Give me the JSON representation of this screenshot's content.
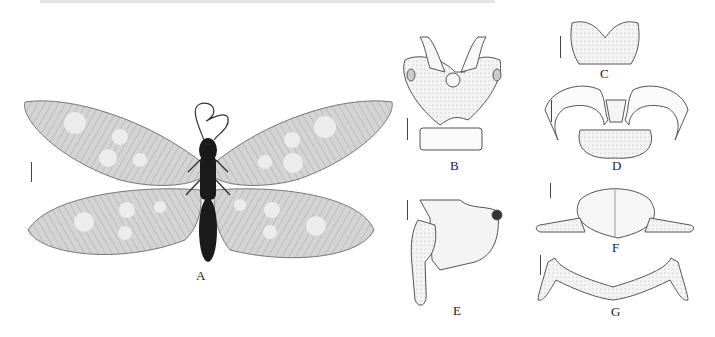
{
  "figure": {
    "panels": [
      {
        "id": "A",
        "label": "A",
        "content": "specimen-photo-adult-dorsal"
      },
      {
        "id": "B",
        "label": "B",
        "content": "line-drawing"
      },
      {
        "id": "C",
        "label": "C",
        "content": "line-drawing"
      },
      {
        "id": "D",
        "label": "D",
        "content": "line-drawing"
      },
      {
        "id": "E",
        "label": "E",
        "content": "line-drawing"
      },
      {
        "id": "F",
        "label": "F",
        "content": "line-drawing"
      },
      {
        "id": "G",
        "label": "G",
        "content": "line-drawing"
      }
    ],
    "colors": {
      "wing_fill": "#cfcfcf",
      "wing_spot": "#ececec",
      "body": "#1a1a1a",
      "line": "#555555",
      "stipple": "#e6e6e6"
    }
  }
}
